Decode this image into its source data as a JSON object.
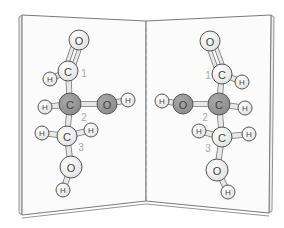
{
  "figure": {
    "colors": {
      "background": "#ffffff",
      "page": "#fbfbfb",
      "page_edge": "#7a7a7a",
      "fold_line": "#9a9a9a",
      "atom_light": "#e2e2e2",
      "atom_dark": "#8c8c8c",
      "atom_stroke": "#555555",
      "bond": "#e8e8e8",
      "bond_stroke": "#777777",
      "number_label": "#a8a8a8"
    },
    "book": {
      "left_page": [
        [
          22,
          15
        ],
        [
          146,
          21
        ],
        [
          146,
          201
        ],
        [
          22,
          215
        ]
      ],
      "right_page": [
        [
          146,
          21
        ],
        [
          271,
          15
        ],
        [
          269,
          213
        ],
        [
          146,
          201
        ]
      ],
      "fold": {
        "x": 146,
        "y1": 21,
        "y2": 201,
        "style": "dashed"
      }
    },
    "molecules": [
      {
        "name": "left-molecule",
        "atoms": [
          {
            "id": "O1",
            "element": "O",
            "x": 79,
            "y": 40,
            "r": 10,
            "shade": "light"
          },
          {
            "id": "C1",
            "element": "C",
            "x": 68,
            "y": 71,
            "r": 10,
            "shade": "light"
          },
          {
            "id": "H1",
            "element": "H",
            "x": 50,
            "y": 79,
            "r": 7,
            "shade": "light"
          },
          {
            "id": "C2",
            "element": "C",
            "x": 70,
            "y": 104,
            "r": 11,
            "shade": "dark"
          },
          {
            "id": "H2",
            "element": "H",
            "x": 45,
            "y": 107,
            "r": 7,
            "shade": "light"
          },
          {
            "id": "O2",
            "element": "O",
            "x": 107,
            "y": 104,
            "r": 10,
            "shade": "dark"
          },
          {
            "id": "H3",
            "element": "H",
            "x": 128,
            "y": 100,
            "r": 7,
            "shade": "light"
          },
          {
            "id": "C3",
            "element": "C",
            "x": 67,
            "y": 136,
            "r": 10,
            "shade": "light"
          },
          {
            "id": "H4",
            "element": "H",
            "x": 42,
            "y": 133,
            "r": 7,
            "shade": "light"
          },
          {
            "id": "H5",
            "element": "H",
            "x": 91,
            "y": 130,
            "r": 7,
            "shade": "light"
          },
          {
            "id": "O3",
            "element": "O",
            "x": 71,
            "y": 167,
            "r": 11,
            "shade": "light"
          },
          {
            "id": "H6",
            "element": "H",
            "x": 63,
            "y": 190,
            "r": 7,
            "shade": "light"
          }
        ],
        "bonds": [
          {
            "a": "O1",
            "b": "C1",
            "double": true
          },
          {
            "a": "C1",
            "b": "H1"
          },
          {
            "a": "C1",
            "b": "C2"
          },
          {
            "a": "C2",
            "b": "H2"
          },
          {
            "a": "C2",
            "b": "O2"
          },
          {
            "a": "O2",
            "b": "H3"
          },
          {
            "a": "C2",
            "b": "C3"
          },
          {
            "a": "C3",
            "b": "H4"
          },
          {
            "a": "C3",
            "b": "H5"
          },
          {
            "a": "C3",
            "b": "O3"
          },
          {
            "a": "O3",
            "b": "H6"
          }
        ],
        "numbers": [
          {
            "text": "1",
            "x": 84,
            "y": 73
          },
          {
            "text": "2",
            "x": 84,
            "y": 117
          },
          {
            "text": "3",
            "x": 81,
            "y": 147
          }
        ]
      },
      {
        "name": "right-molecule",
        "atoms": [
          {
            "id": "O1",
            "element": "O",
            "x": 210,
            "y": 41,
            "r": 10,
            "shade": "light"
          },
          {
            "id": "C1",
            "element": "C",
            "x": 222,
            "y": 74,
            "r": 10,
            "shade": "light"
          },
          {
            "id": "H1",
            "element": "H",
            "x": 242,
            "y": 82,
            "r": 7,
            "shade": "light"
          },
          {
            "id": "C2",
            "element": "C",
            "x": 219,
            "y": 104,
            "r": 11,
            "shade": "dark"
          },
          {
            "id": "H2",
            "element": "H",
            "x": 245,
            "y": 108,
            "r": 7,
            "shade": "light"
          },
          {
            "id": "O2",
            "element": "O",
            "x": 183,
            "y": 104,
            "r": 10,
            "shade": "dark"
          },
          {
            "id": "H3",
            "element": "H",
            "x": 162,
            "y": 101,
            "r": 7,
            "shade": "light"
          },
          {
            "id": "C3",
            "element": "C",
            "x": 222,
            "y": 137,
            "r": 10,
            "shade": "light"
          },
          {
            "id": "H4",
            "element": "H",
            "x": 199,
            "y": 131,
            "r": 7,
            "shade": "light"
          },
          {
            "id": "H5",
            "element": "H",
            "x": 249,
            "y": 134,
            "r": 7,
            "shade": "light"
          },
          {
            "id": "O3",
            "element": "O",
            "x": 217,
            "y": 170,
            "r": 11,
            "shade": "light"
          },
          {
            "id": "H6",
            "element": "H",
            "x": 228,
            "y": 192,
            "r": 7,
            "shade": "light"
          }
        ],
        "bonds": [
          {
            "a": "O1",
            "b": "C1",
            "double": true
          },
          {
            "a": "C1",
            "b": "H1"
          },
          {
            "a": "C1",
            "b": "C2"
          },
          {
            "a": "C2",
            "b": "H2"
          },
          {
            "a": "C2",
            "b": "O2"
          },
          {
            "a": "O2",
            "b": "H3"
          },
          {
            "a": "C2",
            "b": "C3"
          },
          {
            "a": "C3",
            "b": "H4"
          },
          {
            "a": "C3",
            "b": "H5"
          },
          {
            "a": "C3",
            "b": "O3"
          },
          {
            "a": "O3",
            "b": "H6"
          }
        ],
        "numbers": [
          {
            "text": "1",
            "x": 208,
            "y": 75
          },
          {
            "text": "2",
            "x": 205,
            "y": 117
          },
          {
            "text": "3",
            "x": 208,
            "y": 148
          }
        ]
      }
    ]
  }
}
